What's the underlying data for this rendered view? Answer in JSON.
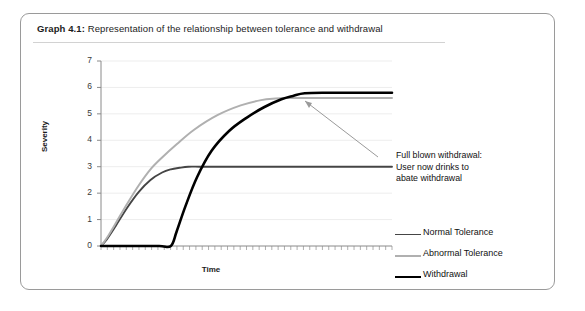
{
  "figure": {
    "caption_label": "Graph 4.1:",
    "caption_text": " Representation of the relationship between tolerance and withdrawal"
  },
  "annotation": {
    "line1": "Full blown withdrawal:",
    "line2": "User now drinks to",
    "line3": "abate withdrawal"
  },
  "chart_data": {
    "type": "line",
    "title": "Representation of the relationship between tolerance and withdrawal",
    "xlabel": "Time",
    "ylabel": "Severity",
    "ylim": [
      0,
      7
    ],
    "xlim": [
      0,
      100
    ],
    "ytick_labels": [
      "7",
      "6",
      "5",
      "4",
      "3",
      "2",
      "1",
      "0"
    ],
    "ytick_values": [
      7,
      6,
      5,
      4,
      3,
      2,
      1,
      0
    ],
    "xtick_labels": [],
    "grid": true,
    "legend_position": "right",
    "series": [
      {
        "name": "Normal Tolerance",
        "color": "#454545",
        "width": 1.9,
        "x": [
          0,
          2,
          5,
          9,
          13,
          17,
          21,
          24,
          27,
          30,
          34,
          40,
          50,
          65,
          80,
          100
        ],
        "y": [
          0,
          0.25,
          0.75,
          1.45,
          2.05,
          2.5,
          2.78,
          2.9,
          2.96,
          3.0,
          3.0,
          3.0,
          3.0,
          3.0,
          3.0,
          3.0
        ]
      },
      {
        "name": "Abnormal Tolerance",
        "color": "#b0b0b0",
        "width": 2.0,
        "x": [
          0,
          2,
          5,
          9,
          13,
          17,
          21,
          26,
          32,
          40,
          48,
          55,
          60,
          64,
          68,
          75,
          85,
          100
        ],
        "y": [
          0,
          0.3,
          0.85,
          1.6,
          2.3,
          2.9,
          3.35,
          3.85,
          4.4,
          4.95,
          5.32,
          5.52,
          5.58,
          5.6,
          5.6,
          5.6,
          5.6,
          5.6
        ]
      },
      {
        "name": "Withdrawal",
        "color": "#000000",
        "width": 2.6,
        "x": [
          0,
          10,
          20,
          24,
          26,
          29,
          33,
          38,
          44,
          50,
          56,
          62,
          66,
          70,
          78,
          88,
          100
        ],
        "y": [
          0,
          0,
          0,
          0,
          0.55,
          1.5,
          2.6,
          3.6,
          4.35,
          4.85,
          5.25,
          5.55,
          5.68,
          5.78,
          5.8,
          5.8,
          5.8
        ]
      }
    ],
    "annotations": [
      {
        "text": "Full blown withdrawal: User now drinks to abate withdrawal",
        "arrow_tip": [
          56,
          5.35
        ]
      }
    ]
  },
  "legend": {
    "items": [
      {
        "label": "Normal Tolerance",
        "color": "#454545"
      },
      {
        "label": "Abnormal Tolerance",
        "color": "#b0b0b0"
      },
      {
        "label": "Withdrawal",
        "color": "#000000"
      }
    ]
  }
}
